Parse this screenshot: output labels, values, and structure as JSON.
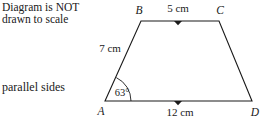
{
  "annotations": {
    "not_to_scale_line1": "Diagram is NOT",
    "not_to_scale_line2": "drawn to scale",
    "parallel_sides": "parallel sides"
  },
  "figure": {
    "shape": "trapezium",
    "stroke_color": "#1a1a1a",
    "vertices": [
      {
        "id": "A",
        "label": "A",
        "x": 105,
        "y": 101
      },
      {
        "id": "B",
        "label": "B",
        "x": 141,
        "y": 21
      },
      {
        "id": "C",
        "label": "C",
        "x": 219,
        "y": 21
      },
      {
        "id": "D",
        "label": "D",
        "x": 252,
        "y": 101
      }
    ],
    "sides": [
      {
        "id": "BC",
        "label": "5 cm",
        "value": 5,
        "unit": "cm",
        "parallel_mark": true
      },
      {
        "id": "AD",
        "label": "12 cm",
        "value": 12,
        "unit": "cm",
        "parallel_mark": true
      },
      {
        "id": "AB",
        "label": "7 cm",
        "value": 7,
        "unit": "cm",
        "parallel_mark": false
      }
    ],
    "angles": [
      {
        "id": "angle-A",
        "label": "63°",
        "value": 63,
        "unit": "degrees",
        "at_vertex": "A"
      }
    ]
  }
}
